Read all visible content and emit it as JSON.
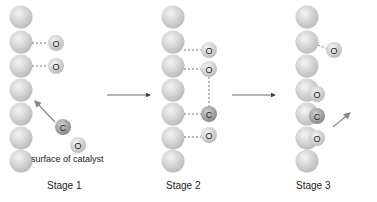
{
  "stages": [
    {
      "label": "Stage 1"
    },
    {
      "label": "Stage 2"
    },
    {
      "label": "Stage 3"
    }
  ],
  "surface_label": "surface of catalyst",
  "atoms": {
    "carbon": "C",
    "oxygen": "O"
  },
  "colors": {
    "catalyst": "#d8d8d8",
    "oxygen": "#d0d0d0",
    "carbon": "#a8a8a8",
    "line": "#555555"
  }
}
